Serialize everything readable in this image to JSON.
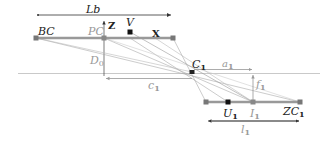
{
  "diagram": {
    "labels": {
      "lb": "Lb",
      "bc": "BC",
      "pc": "PC",
      "z": "Z",
      "v": "V",
      "x": "X",
      "d0": "D",
      "d0_sub": "0",
      "c1": "C",
      "c1_sub": "1",
      "a1": "a",
      "a1_sub": "1",
      "c1_dist": "c",
      "c1_dist_sub": "1",
      "f1": "f",
      "f1_sub": "1",
      "u1": "U",
      "u1_sub": "1",
      "i1": "I",
      "i1_sub": "1",
      "zc1": "ZC",
      "zc1_sub": "1",
      "l1": "l",
      "l1_sub": "1"
    },
    "colors": {
      "bar": "#999999",
      "thin_line": "#aaaaaa",
      "dark": "#222222",
      "marker": "#777777"
    }
  }
}
